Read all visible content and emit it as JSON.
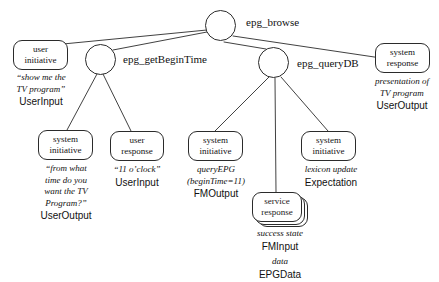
{
  "diagram": {
    "root_label": "epg_browse",
    "branch_labels": {
      "left": "epg_getBeginTime",
      "right": "epg_queryDB"
    },
    "nodes": [
      {
        "id": "root-circle",
        "kind": "circle",
        "label": ""
      },
      {
        "id": "getbegintime-circle",
        "kind": "circle",
        "label": ""
      },
      {
        "id": "querydb-circle",
        "kind": "circle",
        "label": ""
      },
      {
        "id": "user-initiative",
        "kind": "box",
        "line1": "user",
        "line2": "initiative"
      },
      {
        "id": "system-response",
        "kind": "box",
        "line1": "system",
        "line2": "response"
      },
      {
        "id": "system-initiative-time",
        "kind": "box",
        "line1": "system",
        "line2": "initiative"
      },
      {
        "id": "user-response-time",
        "kind": "box",
        "line1": "user",
        "line2": "response"
      },
      {
        "id": "system-initiative-query",
        "kind": "box",
        "line1": "system",
        "line2": "initiative"
      },
      {
        "id": "service-response",
        "kind": "stack",
        "line1": "service",
        "line2": "response"
      },
      {
        "id": "system-initiative-lexicon",
        "kind": "box",
        "line1": "system",
        "line2": "initiative"
      }
    ],
    "annotations": [
      {
        "id": "ann-user-initiative",
        "italic_lines": [
          "“show me the",
          "TV program”"
        ],
        "type_lines": [
          "UserInput"
        ]
      },
      {
        "id": "ann-system-response",
        "italic_lines": [
          "presentation of",
          "TV program"
        ],
        "type_lines": [
          "UserOutput"
        ]
      },
      {
        "id": "ann-system-initiative-time",
        "italic_lines": [
          "“from what",
          "time do you",
          "want the TV",
          "Program?”"
        ],
        "type_lines": [
          "UserOutput"
        ]
      },
      {
        "id": "ann-user-response-time",
        "italic_lines": [
          "“11 o’clock”"
        ],
        "type_lines": [
          "UserInput"
        ]
      },
      {
        "id": "ann-system-initiative-query",
        "italic_lines": [
          "queryEPG",
          "(beginTime=11)"
        ],
        "type_lines": [
          "FMOutput"
        ]
      },
      {
        "id": "ann-service-response",
        "italic_lines": [
          "success state"
        ],
        "type_lines": [
          "FMInput"
        ],
        "italic_lines2": [
          "data"
        ],
        "type_lines2": [
          "EPGData"
        ]
      },
      {
        "id": "ann-system-initiative-lexicon",
        "italic_lines": [
          "lexicon update"
        ],
        "type_lines": [
          "Expectation"
        ]
      }
    ],
    "colors": {
      "stroke": "#2b2b2b",
      "text": "#111111",
      "background": "#ffffff"
    }
  }
}
